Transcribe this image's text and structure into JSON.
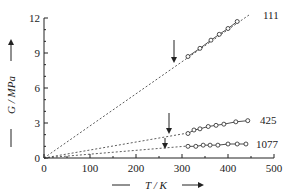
{
  "chart_data": {
    "type": "scatter",
    "title": "",
    "xlabel": "T / K",
    "ylabel": "G / MPa",
    "xlim": [
      0,
      500
    ],
    "ylim": [
      0,
      12
    ],
    "x_ticks": [
      0,
      100,
      200,
      300,
      400,
      500
    ],
    "y_ticks": [
      0,
      3,
      6,
      9,
      12
    ],
    "y_minor_step": 1,
    "x_minor_step": 50,
    "grid": false,
    "legend": "inline labels at right end of each series",
    "series": [
      {
        "name": "111",
        "label": "111",
        "x": [
          313,
          339,
          363,
          381,
          400,
          420
        ],
        "y": [
          8.7,
          9.4,
          10.1,
          10.6,
          11.1,
          11.7
        ],
        "fit_line": {
          "style": "dashed",
          "from": [
            0,
            0
          ],
          "to": [
            445,
            12.2
          ]
        },
        "arrow_at_x": 283
      },
      {
        "name": "425",
        "label": "425",
        "x": [
          313,
          326,
          339,
          357,
          374,
          391,
          417,
          443
        ],
        "y": [
          2.1,
          2.4,
          2.5,
          2.7,
          2.8,
          2.9,
          3.1,
          3.2
        ],
        "fit_line": {
          "style": "dashed",
          "from": [
            0,
            0
          ],
          "to": [
            313,
            2.1
          ]
        },
        "arrow_at_x": 272
      },
      {
        "name": "1077",
        "label": "1077",
        "x": [
          313,
          330,
          346,
          361,
          378,
          400,
          420,
          439
        ],
        "y": [
          1.0,
          1.0,
          1.1,
          1.1,
          1.1,
          1.2,
          1.2,
          1.2
        ],
        "fit_line": {
          "style": "dashed",
          "from": [
            0,
            0
          ],
          "to": [
            313,
            1.0
          ]
        },
        "arrow_at_x": 263
      }
    ],
    "annotations": [
      "downward arrows marking transition temperature on each series"
    ]
  },
  "axes": {
    "x_title": "T / K",
    "y_title": "G / MPa",
    "x_tick_labels": [
      "0",
      "100",
      "200",
      "300",
      "400",
      "500"
    ],
    "y_tick_labels": [
      "0",
      "3",
      "6",
      "9",
      "12"
    ]
  },
  "labels": {
    "s111": "111",
    "s425": "425",
    "s1077": "1077"
  },
  "colors": {
    "ink": "#222222",
    "background": "#ffffff"
  }
}
